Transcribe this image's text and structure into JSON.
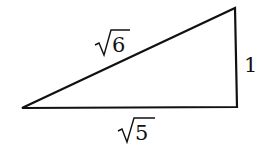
{
  "diagram": {
    "type": "right-triangle",
    "vertices": {
      "left": [
        22,
        108
      ],
      "bottom_right": [
        237,
        107
      ],
      "top_right": [
        235,
        8
      ]
    },
    "labels": {
      "hypotenuse": "6",
      "vertical_leg": "1",
      "horizontal_leg": "5"
    },
    "stroke_color": "#111111"
  }
}
